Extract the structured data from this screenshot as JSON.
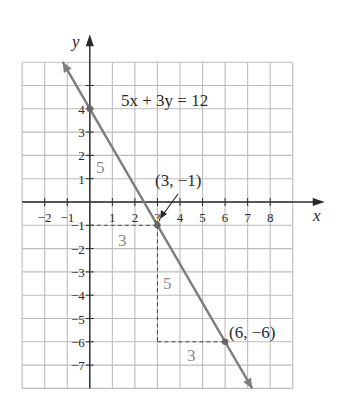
{
  "chart_data": {
    "type": "line",
    "title": "",
    "equation": "5x + 3y = 12",
    "xlabel": "x",
    "ylabel": "y",
    "xlim": [
      -3,
      9
    ],
    "ylim": [
      -8,
      6
    ],
    "grid": true,
    "x_ticks": [
      -2,
      -1,
      1,
      2,
      3,
      4,
      5,
      6,
      7,
      8
    ],
    "y_ticks": [
      4,
      3,
      2,
      1,
      -1,
      -2,
      -3,
      -4,
      -5,
      -6,
      -7
    ],
    "x_tick_labels": [
      "−2",
      "−1",
      "1",
      "2",
      "3",
      "4",
      "5",
      "6",
      "7",
      "8"
    ],
    "y_tick_labels": [
      "4",
      "3",
      "2",
      "1",
      "−1",
      "−2",
      "−3",
      "−4",
      "−5",
      "−6",
      "−7"
    ],
    "series": [
      {
        "name": "5x + 3y = 12",
        "x": [
          -1.2,
          7.2
        ],
        "y": [
          6.0,
          -8.0
        ],
        "slope": -1.6667,
        "y_intercept": 4
      }
    ],
    "points": [
      {
        "x": 0,
        "y": 4,
        "label": ""
      },
      {
        "x": 3,
        "y": -1,
        "label": "(3, −1)"
      },
      {
        "x": 6,
        "y": -6,
        "label": "(6, −6)"
      }
    ],
    "annotations": [
      {
        "text": "5",
        "type": "rise",
        "at": "x=0, from y=4 to y=-1"
      },
      {
        "text": "3",
        "type": "run",
        "at": "y=-1, from x=0 to x=3"
      },
      {
        "text": "5",
        "type": "rise",
        "at": "x=3, from y=-1 to y=-6"
      },
      {
        "text": "3",
        "type": "run",
        "at": "y=-6, from x=3 to x=6"
      }
    ]
  },
  "labels": {
    "equation": "5x + 3y = 12",
    "x_axis": "x",
    "y_axis": "y",
    "point_a": "(3, −1)",
    "point_b": "(6, −6)",
    "rise1": "5",
    "run1": "3",
    "rise2": "5",
    "run2": "3"
  }
}
